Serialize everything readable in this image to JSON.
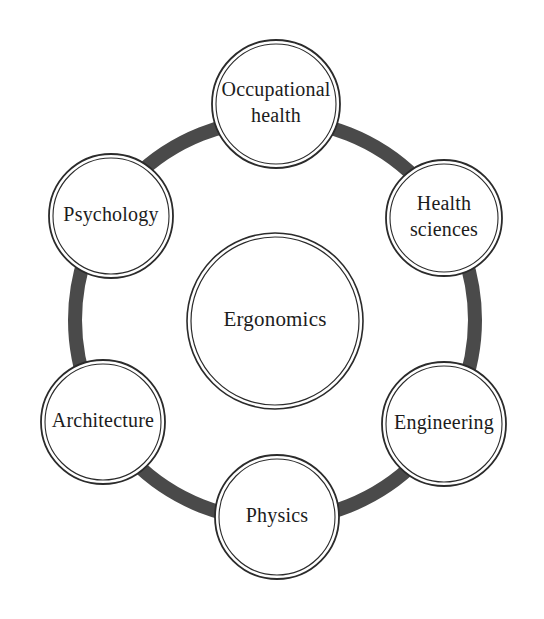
{
  "diagram": {
    "type": "hub-and-spoke-ring",
    "center": {
      "label": "Ergonomics",
      "cx": 275,
      "cy": 321,
      "r": 88
    },
    "ring": {
      "cx": 275,
      "cy": 320,
      "r": 200,
      "color": "#4a4a4a",
      "stroke_width": 14
    },
    "outline_color": "#2b2b2b",
    "text_color": "#1c1c1c",
    "background_color": "#ffffff",
    "nodes": [
      {
        "id": "occupational-health",
        "label": "Occupational health",
        "line1": "Occupational",
        "line2": "health",
        "cx": 276,
        "cy": 104,
        "r": 64
      },
      {
        "id": "health-sciences",
        "label": "Health sciences",
        "line1": "Health",
        "line2": "sciences",
        "cx": 444,
        "cy": 218,
        "r": 58
      },
      {
        "id": "engineering",
        "label": "Engineering",
        "line1": "Engineering",
        "line2": "",
        "cx": 444,
        "cy": 424,
        "r": 62
      },
      {
        "id": "physics",
        "label": "Physics",
        "line1": "Physics",
        "line2": "",
        "cx": 277,
        "cy": 517,
        "r": 62
      },
      {
        "id": "architecture",
        "label": "Architecture",
        "line1": "Architecture",
        "line2": "",
        "cx": 103,
        "cy": 422,
        "r": 62
      },
      {
        "id": "psychology",
        "label": "Psychology",
        "line1": "Psychology",
        "line2": "",
        "cx": 111,
        "cy": 216,
        "r": 62
      }
    ]
  }
}
